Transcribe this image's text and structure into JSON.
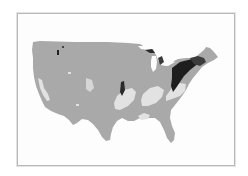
{
  "map": {
    "type": "choropleth",
    "region": "Contiguous United States",
    "color_scheme": "grayscale",
    "colors": {
      "base": "#a9a9a9",
      "light": "#e2e2e2",
      "dark": "#1e1e1e",
      "mid_dark": "#5a5a5a",
      "background": "#fdfdfd",
      "frame": "#b8b8b8"
    },
    "highlighted_areas": [
      {
        "name": "Northeast / Mid-Atlantic",
        "shade": "dark"
      },
      {
        "name": "Michigan Upper",
        "shade": "dark"
      },
      {
        "name": "Central Plains strip",
        "shade": "dark"
      },
      {
        "name": "Ozarks / Mid-South",
        "shade": "light"
      },
      {
        "name": "Tennessee / Kentucky",
        "shade": "light"
      },
      {
        "name": "Virginia / Carolinas",
        "shade": "light"
      },
      {
        "name": "Gulf Coast",
        "shade": "light"
      },
      {
        "name": "West Coast scattered",
        "shade": "light"
      }
    ]
  }
}
